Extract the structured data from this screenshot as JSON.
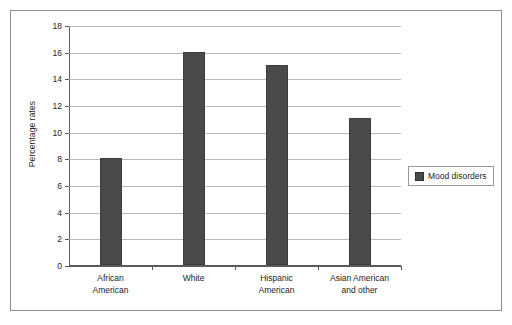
{
  "chart_data": {
    "type": "bar",
    "title": "",
    "subtitle": "",
    "xlabel": "",
    "ylabel": "Percentage rates",
    "categories": [
      "African American",
      "White",
      "Hispanic American",
      "Asian American and other"
    ],
    "category_lines": [
      [
        "African",
        "American"
      ],
      [
        "White"
      ],
      [
        "Hispanic",
        "American"
      ],
      [
        "Asian American",
        "and other"
      ]
    ],
    "values": [
      8,
      16,
      15,
      11
    ],
    "series": [
      {
        "name": "Mood disorders",
        "values": [
          8,
          16,
          15,
          11
        ],
        "color": "#4a4a4a"
      }
    ],
    "ylim": [
      0,
      18
    ],
    "ytick_step": 2,
    "ytick_labels": [
      "0",
      "2",
      "4",
      "6",
      "8",
      "10",
      "12",
      "14",
      "16",
      "18"
    ],
    "grid": true,
    "grid_axis": "y",
    "legend": {
      "position": "right",
      "entries": [
        {
          "label": "Mood disorders",
          "color": "#4a4a4a"
        }
      ]
    },
    "colors": {
      "bar_fill": "#4a4a4a",
      "bar_edge": "#3d3d3d",
      "gridline": "#b8b8b8",
      "axis": "#5a5a5a",
      "frame": "#8d8d8d",
      "background": "#ffffff",
      "text": "#1c1c1c"
    }
  }
}
